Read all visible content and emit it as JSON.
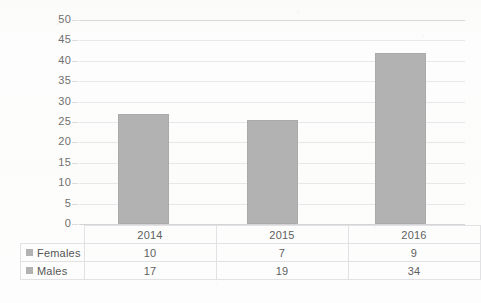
{
  "chart_data": {
    "type": "bar",
    "subtype": "stacked-column",
    "title": "",
    "xlabel": "",
    "ylabel": "",
    "categories": [
      "2014",
      "2015",
      "2016"
    ],
    "series": [
      {
        "name": "Females",
        "values": [
          10,
          7,
          9
        ],
        "color": "#b2b2b2"
      },
      {
        "name": "Males",
        "values": [
          17,
          19,
          34
        ],
        "color": "#b2b2b2"
      }
    ],
    "totals": [
      27,
      26,
      43
    ],
    "bar_tops": [
      27,
      25.5,
      42
    ],
    "ylim": [
      0,
      50
    ],
    "ytick_step": 5,
    "yticks": [
      "0",
      "5",
      "10",
      "15",
      "20",
      "25",
      "30",
      "35",
      "40",
      "45",
      "50"
    ],
    "grid": true,
    "legend_position": "data-table-left",
    "has_data_table": true
  },
  "table": {
    "header_row": [
      "",
      "2014",
      "2015",
      "2016"
    ],
    "rows": [
      {
        "label": "Females",
        "swatch": "legend-swatch-females",
        "values": [
          "10",
          "7",
          "9"
        ]
      },
      {
        "label": "Males",
        "swatch": "legend-swatch-males",
        "values": [
          "17",
          "19",
          "34"
        ]
      }
    ]
  },
  "axis": {
    "y_labels": [
      "50",
      "45",
      "40",
      "35",
      "30",
      "25",
      "20",
      "15",
      "10",
      "5",
      "0"
    ]
  },
  "colors": {
    "bar": "#b2b2b2",
    "bar_border": "#aaaaaa",
    "gridline": "#e8e8ea",
    "table_border": "#e2e2e4",
    "text": "#5f5f5f",
    "background": "#fdfdfd"
  }
}
